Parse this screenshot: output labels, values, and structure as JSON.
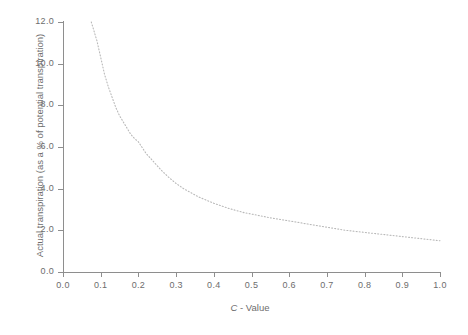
{
  "chart_data": {
    "type": "line",
    "title": "",
    "xlabel": "C - Value",
    "xlabel_italic_part": "C",
    "xlabel_rest": "- Value",
    "ylabel": "Actual transpiration (as a % of potential transpiration)",
    "xlim": [
      0.0,
      1.0
    ],
    "ylim": [
      0.0,
      12.0
    ],
    "grid": false,
    "legend": null,
    "line_style": "dotted",
    "line_color": "#b9b9b9",
    "axis_color": "#8e8e8e",
    "text_color": "#6d6d6d",
    "background_color": "#ffffff",
    "xticks": [
      0.0,
      0.1,
      0.2,
      0.3,
      0.4,
      0.5,
      0.6,
      0.7,
      0.8,
      0.9,
      1.0
    ],
    "xticklabels": [
      "0.0",
      "0.1",
      "0.2",
      "0.3",
      "0.4",
      "0.5",
      "0.6",
      "0.7",
      "0.8",
      "0.9",
      "1.0"
    ],
    "yticks": [
      0.0,
      2.0,
      4.0,
      6.0,
      8.0,
      10.0,
      12.0
    ],
    "yticklabels": [
      "0.0",
      "2.0",
      "4.0",
      "6.0",
      "8.0",
      "10.0",
      "12.0"
    ],
    "series": [
      {
        "name": "Actual transpiration vs C-Value",
        "x": [
          0.075,
          0.09,
          0.1,
          0.11,
          0.12,
          0.13,
          0.14,
          0.15,
          0.16,
          0.17,
          0.18,
          0.19,
          0.2,
          0.22,
          0.24,
          0.26,
          0.28,
          0.3,
          0.32,
          0.34,
          0.36,
          0.38,
          0.4,
          0.44,
          0.48,
          0.5,
          0.55,
          0.6,
          0.65,
          0.7,
          0.75,
          0.8,
          0.85,
          0.9,
          0.95,
          1.0
        ],
        "y": [
          12.0,
          11.1,
          10.3,
          9.5,
          8.9,
          8.4,
          7.9,
          7.5,
          7.2,
          6.9,
          6.6,
          6.4,
          6.25,
          5.7,
          5.3,
          4.9,
          4.55,
          4.25,
          4.0,
          3.8,
          3.6,
          3.45,
          3.3,
          3.05,
          2.85,
          2.78,
          2.6,
          2.45,
          2.3,
          2.15,
          2.0,
          1.9,
          1.8,
          1.7,
          1.6,
          1.5
        ]
      }
    ]
  }
}
